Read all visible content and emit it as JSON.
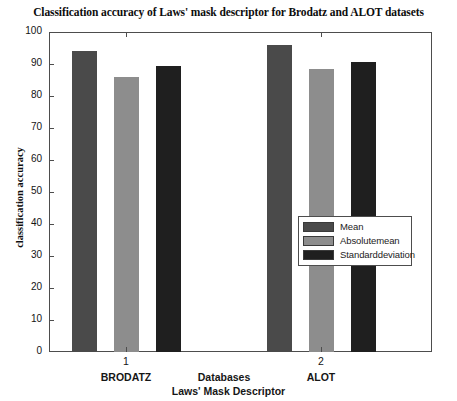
{
  "chart_data": {
    "type": "bar",
    "title": "Classification accuracy of Laws' mask descriptor for Brodatz and ALOT datasets",
    "xlabel": "Laws' Mask Descriptor",
    "ylabel": "classification accuracy",
    "axis_note": "Databases",
    "categories": [
      "1",
      "2"
    ],
    "category_names": [
      "BRODATZ",
      "ALOT"
    ],
    "series": [
      {
        "name": "Mean",
        "color": "#4a4a4a",
        "values": [
          94,
          96
        ]
      },
      {
        "name": "Absolutemean",
        "color": "#8d8d8d",
        "values": [
          86,
          88.5
        ]
      },
      {
        "name": "Standarddeviation",
        "color": "#1f1f1f",
        "values": [
          89.5,
          90.5
        ]
      }
    ],
    "ylim": [
      0,
      100
    ],
    "yticks": [
      0,
      10,
      20,
      30,
      40,
      50,
      60,
      70,
      80,
      90,
      100
    ],
    "ytick_labels": [
      "0",
      "10",
      "20",
      "30",
      "40",
      "50",
      "60",
      "70",
      "80",
      "90",
      "100"
    ],
    "grid": false,
    "legend_position": "center-right-inside"
  },
  "legend": {
    "items": [
      {
        "label": "Mean",
        "color": "#4a4a4a"
      },
      {
        "label": "Absolutemean",
        "color": "#8d8d8d"
      },
      {
        "label": "Standarddeviation",
        "color": "#1f1f1f"
      }
    ]
  }
}
